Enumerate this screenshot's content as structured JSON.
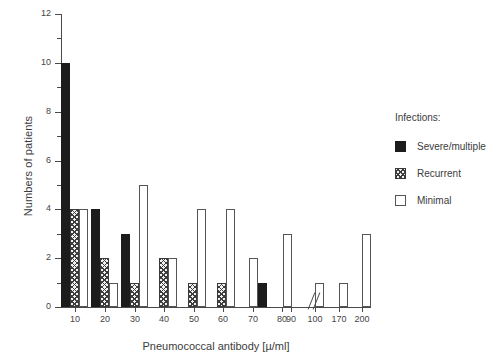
{
  "chart_data": {
    "type": "bar",
    "title": "",
    "xlabel": "Pneumococcal antibody [µ/ml]",
    "ylabel": "Numbers of patients",
    "ylim": [
      0,
      12
    ],
    "yticks": [
      0,
      2,
      4,
      6,
      8,
      10,
      12
    ],
    "ytick_labels": [
      "0",
      "2",
      "4",
      "6",
      "8",
      "10",
      "12"
    ],
    "yminor_ticks": [
      1,
      3,
      5,
      7,
      9,
      11
    ],
    "categories": [
      "10",
      "20",
      "30",
      "40",
      "50",
      "60",
      "70",
      "80",
      "90",
      "100",
      "170",
      "200"
    ],
    "xtick_labels": [
      "10",
      "20",
      "30",
      "40",
      "50",
      "60",
      "70",
      "80",
      "90",
      "100",
      "170",
      "200"
    ],
    "axis_break": true,
    "axis_break_between": [
      "100",
      "170"
    ],
    "grid": false,
    "legend_position": "right",
    "series": [
      {
        "name": "Severe/multiple",
        "fill": "solid-black",
        "color": "#1c1c1c",
        "values": [
          10,
          4,
          3,
          0,
          0,
          0,
          0,
          1,
          0,
          0,
          0,
          0
        ]
      },
      {
        "name": "Recurrent",
        "fill": "hatched",
        "color": "#3d3d3d",
        "values": [
          4,
          2,
          1,
          2,
          1,
          1,
          0,
          0,
          0,
          0,
          0,
          0
        ]
      },
      {
        "name": "Minimal",
        "fill": "open-white",
        "color": "#ffffff",
        "values": [
          4,
          1,
          5,
          2,
          4,
          4,
          2,
          0,
          3,
          1,
          1,
          3
        ]
      }
    ],
    "bars": [
      {
        "series": "Severe/multiple",
        "x_px": 61,
        "w_px": 9,
        "value": 10
      },
      {
        "series": "Recurrent",
        "x_px": 70,
        "w_px": 9,
        "value": 4
      },
      {
        "series": "Minimal",
        "x_px": 79,
        "w_px": 9,
        "value": 4
      },
      {
        "series": "Severe/multiple",
        "x_px": 91,
        "w_px": 9,
        "value": 4
      },
      {
        "series": "Recurrent",
        "x_px": 100,
        "w_px": 9,
        "value": 2
      },
      {
        "series": "Minimal",
        "x_px": 109,
        "w_px": 9,
        "value": 1
      },
      {
        "series": "Severe/multiple",
        "x_px": 121,
        "w_px": 9,
        "value": 3
      },
      {
        "series": "Recurrent",
        "x_px": 130,
        "w_px": 9,
        "value": 1
      },
      {
        "series": "Minimal",
        "x_px": 139,
        "w_px": 9,
        "value": 5
      },
      {
        "series": "Recurrent",
        "x_px": 159,
        "w_px": 9,
        "value": 2
      },
      {
        "series": "Minimal",
        "x_px": 168,
        "w_px": 9,
        "value": 2
      },
      {
        "series": "Recurrent",
        "x_px": 188,
        "w_px": 9,
        "value": 1
      },
      {
        "series": "Minimal",
        "x_px": 197,
        "w_px": 9,
        "value": 4
      },
      {
        "series": "Recurrent",
        "x_px": 217,
        "w_px": 9,
        "value": 1
      },
      {
        "series": "Minimal",
        "x_px": 226,
        "w_px": 9,
        "value": 4
      },
      {
        "series": "Minimal",
        "x_px": 249,
        "w_px": 9,
        "value": 2
      },
      {
        "series": "Severe/multiple",
        "x_px": 258,
        "w_px": 9,
        "value": 1
      },
      {
        "series": "Minimal",
        "x_px": 283,
        "w_px": 9,
        "value": 3
      },
      {
        "series": "Minimal",
        "x_px": 315,
        "w_px": 9,
        "value": 1
      },
      {
        "series": "Minimal",
        "x_px": 339,
        "w_px": 9,
        "value": 1
      },
      {
        "series": "Minimal",
        "x_px": 362,
        "w_px": 9,
        "value": 3
      }
    ]
  },
  "legend": {
    "title": "Infections:",
    "items": [
      {
        "label": "Severe/multiple",
        "fill": "severe"
      },
      {
        "label": "Recurrent",
        "fill": "recurrent"
      },
      {
        "label": "Minimal",
        "fill": "minimal"
      }
    ]
  },
  "axes": {
    "xtick_px": [
      75,
      105,
      135,
      164,
      194,
      223,
      253,
      282,
      291,
      315,
      339,
      362
    ],
    "xtick_px_labeled": [
      75,
      105,
      135,
      164,
      194,
      223,
      253,
      282,
      291,
      315,
      339,
      362
    ]
  }
}
